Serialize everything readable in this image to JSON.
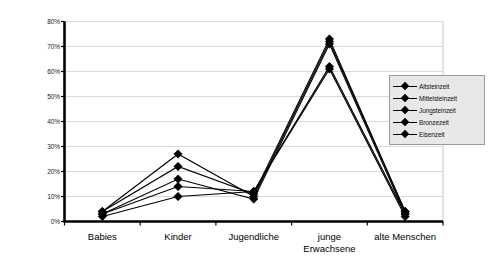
{
  "chart_data": {
    "type": "line",
    "title": "",
    "xlabel": "",
    "ylabel": "Anteil pro Epoche",
    "ylim": [
      0,
      80
    ],
    "ytick_labels": [
      "0%",
      "10%",
      "20%",
      "30%",
      "40%",
      "50%",
      "60%",
      "70%",
      "80%"
    ],
    "ytick_values": [
      0,
      10,
      20,
      30,
      40,
      50,
      60,
      70,
      80
    ],
    "grid": true,
    "grid_axis": "y",
    "legend_position": "right",
    "marker": "diamond",
    "line_color": "#000000",
    "categories": [
      "Babies",
      "Kinder",
      "Jugendliche",
      "junge\nErwachsene",
      "alte Menschen"
    ],
    "series": [
      {
        "name": "Altsteinzeit",
        "values": [
          4,
          27,
          10,
          72,
          4
        ]
      },
      {
        "name": "Mittelsteinzeit",
        "values": [
          4,
          22,
          11,
          73,
          4
        ]
      },
      {
        "name": "Jungsteinzeit",
        "values": [
          3,
          17,
          9,
          71,
          3
        ]
      },
      {
        "name": "Bronzezeit",
        "values": [
          3,
          14,
          12,
          62,
          3
        ]
      },
      {
        "name": "Eisenzeit",
        "values": [
          2,
          10,
          12,
          61,
          2
        ]
      }
    ]
  },
  "legend": {
    "entries": [
      "Altsteinzeit",
      "Mittelsteinzeit",
      "Jungsteinzeit",
      "Bronzezeit",
      "Eisenzeit"
    ]
  },
  "axes": {
    "y_title": "Anteil pro Epoche"
  },
  "colors": {
    "series": "#000000",
    "grid": "#d9d9d9",
    "axis": "#000000",
    "legend_bg": "#e8e8e8",
    "legend_border": "#9a9a9a",
    "plot_border": "#c8c8c8"
  }
}
